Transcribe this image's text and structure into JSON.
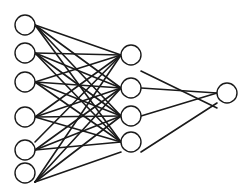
{
  "diagram": {
    "type": "neural-network",
    "width": 251,
    "height": 190,
    "colors": {
      "stroke": "#1a1a1a",
      "fill": "#ffffff",
      "background": "#ffffff"
    },
    "node_radius": 10,
    "layers": [
      {
        "name": "input",
        "nodes": [
          {
            "x": 25,
            "y": 25
          },
          {
            "x": 25,
            "y": 53
          },
          {
            "x": 25,
            "y": 82
          },
          {
            "x": 25,
            "y": 117
          },
          {
            "x": 25,
            "y": 150
          },
          {
            "x": 25,
            "y": 173
          }
        ]
      },
      {
        "name": "hidden",
        "nodes": [
          {
            "x": 131,
            "y": 55
          },
          {
            "x": 131,
            "y": 88
          },
          {
            "x": 131,
            "y": 116
          },
          {
            "x": 131,
            "y": 142
          }
        ]
      },
      {
        "name": "output",
        "nodes": [
          {
            "x": 227,
            "y": 93
          }
        ]
      }
    ],
    "edges": [
      [
        35,
        25,
        121,
        55
      ],
      [
        35,
        25,
        121,
        88
      ],
      [
        35,
        25,
        121,
        116
      ],
      [
        35,
        25,
        121,
        142
      ],
      [
        35,
        53,
        121,
        55
      ],
      [
        35,
        53,
        121,
        88
      ],
      [
        35,
        53,
        121,
        116
      ],
      [
        35,
        53,
        121,
        142
      ],
      [
        35,
        82,
        121,
        55
      ],
      [
        35,
        82,
        121,
        88
      ],
      [
        35,
        82,
        121,
        116
      ],
      [
        35,
        82,
        121,
        142
      ],
      [
        35,
        117,
        121,
        55
      ],
      [
        35,
        117,
        121,
        88
      ],
      [
        35,
        117,
        121,
        116
      ],
      [
        35,
        117,
        121,
        142
      ],
      [
        35,
        142,
        121,
        55
      ],
      [
        35,
        150,
        121,
        88
      ],
      [
        35,
        150,
        121,
        116
      ],
      [
        35,
        150,
        121,
        142
      ],
      [
        35,
        182,
        121,
        55
      ],
      [
        35,
        182,
        121,
        88
      ],
      [
        35,
        182,
        121,
        116
      ],
      [
        35,
        182,
        121,
        152
      ],
      [
        141,
        71,
        217,
        108
      ],
      [
        141,
        88,
        217,
        93
      ],
      [
        141,
        116,
        217,
        93
      ],
      [
        141,
        152,
        217,
        103
      ]
    ]
  }
}
